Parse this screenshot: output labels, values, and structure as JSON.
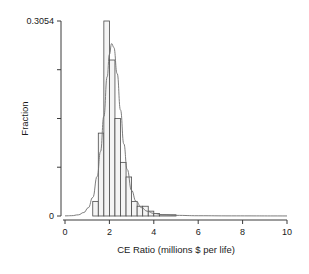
{
  "chart_data": {
    "type": "bar",
    "title": "",
    "xlabel": "CE Ratio (millions $ per life)",
    "ylabel": "Fraction",
    "xlim": [
      0,
      10
    ],
    "ylim": [
      0,
      0.3054
    ],
    "grid": false,
    "legend": null,
    "bin_width": 0.25,
    "x_tick_labels": [
      "0",
      "2",
      "4",
      "6",
      "8",
      "10"
    ],
    "x_tick_values": [
      0,
      2,
      4,
      6,
      8,
      10
    ],
    "y_tick_labels": [
      "0",
      "0.3054"
    ],
    "y_tick_values": [
      0,
      0.3054
    ],
    "y_minor_tick_values": [
      0.0764,
      0.1527,
      0.2291
    ],
    "bins": [
      {
        "x0": 1.0,
        "x1": 1.25,
        "value": 0.0
      },
      {
        "x0": 1.25,
        "x1": 1.5,
        "value": 0.0229
      },
      {
        "x0": 1.5,
        "x1": 1.75,
        "value": 0.1298
      },
      {
        "x0": 1.75,
        "x1": 2.0,
        "value": 0.3054
      },
      {
        "x0": 2.0,
        "x1": 2.25,
        "value": 0.2443
      },
      {
        "x0": 2.25,
        "x1": 2.5,
        "value": 0.1527
      },
      {
        "x0": 2.5,
        "x1": 2.75,
        "value": 0.084
      },
      {
        "x0": 2.75,
        "x1": 3.0,
        "value": 0.0611
      },
      {
        "x0": 3.0,
        "x1": 3.25,
        "value": 0.0229
      },
      {
        "x0": 3.25,
        "x1": 3.5,
        "value": 0.0153
      },
      {
        "x0": 3.5,
        "x1": 3.75,
        "value": 0.0153
      },
      {
        "x0": 3.75,
        "x1": 4.0,
        "value": 0.0076
      },
      {
        "x0": 4.0,
        "x1": 4.25,
        "value": 0.0038
      },
      {
        "x0": 4.25,
        "x1": 5.0,
        "value": 0.0019
      }
    ],
    "density_curve": {
      "label": "fitted density overlay",
      "points": [
        {
          "x": 0.0,
          "y": 0.0002
        },
        {
          "x": 0.3,
          "y": 0.0005
        },
        {
          "x": 0.6,
          "y": 0.0018
        },
        {
          "x": 0.85,
          "y": 0.0055
        },
        {
          "x": 1.05,
          "y": 0.013
        },
        {
          "x": 1.25,
          "y": 0.029
        },
        {
          "x": 1.45,
          "y": 0.062
        },
        {
          "x": 1.6,
          "y": 0.101
        },
        {
          "x": 1.75,
          "y": 0.156
        },
        {
          "x": 1.9,
          "y": 0.218
        },
        {
          "x": 2.0,
          "y": 0.253
        },
        {
          "x": 2.1,
          "y": 0.27
        },
        {
          "x": 2.2,
          "y": 0.264
        },
        {
          "x": 2.35,
          "y": 0.223
        },
        {
          "x": 2.5,
          "y": 0.166
        },
        {
          "x": 2.65,
          "y": 0.113
        },
        {
          "x": 2.8,
          "y": 0.073
        },
        {
          "x": 3.0,
          "y": 0.04
        },
        {
          "x": 3.2,
          "y": 0.023
        },
        {
          "x": 3.45,
          "y": 0.013
        },
        {
          "x": 3.7,
          "y": 0.0075
        },
        {
          "x": 4.0,
          "y": 0.004
        },
        {
          "x": 4.4,
          "y": 0.002
        },
        {
          "x": 5.0,
          "y": 0.001
        },
        {
          "x": 6.0,
          "y": 0.0004
        },
        {
          "x": 7.5,
          "y": 0.0002
        },
        {
          "x": 10.0,
          "y": 0.0001
        }
      ]
    }
  }
}
